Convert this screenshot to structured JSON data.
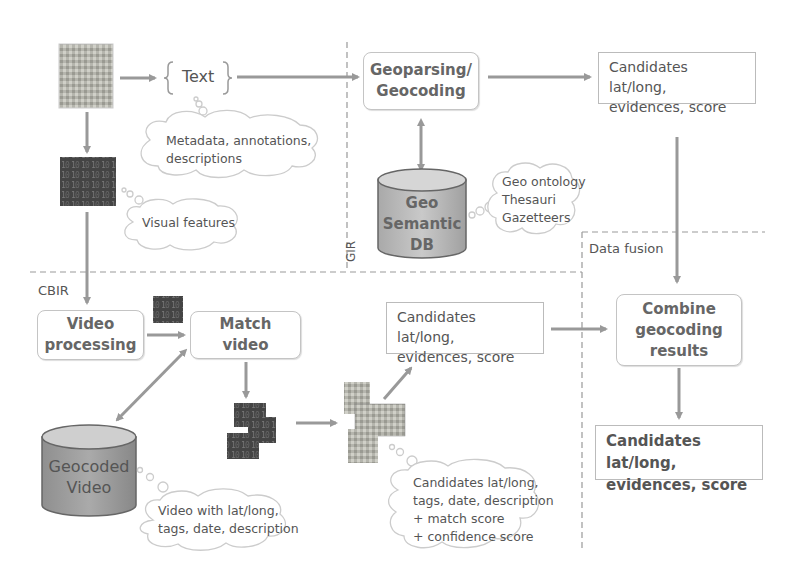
{
  "diagram": {
    "regions": {
      "gir": "GIR",
      "cbir": "CBIR",
      "fusion": "Data fusion"
    },
    "text_node": "Text",
    "boxes": {
      "geoparsing_line1": "Geoparsing/",
      "geoparsing_line2": "Geocoding",
      "video_processing_line1": "Video",
      "video_processing_line2": "processing",
      "match_video_line1": "Match",
      "match_video_line2": "video",
      "combine_line1": "Combine",
      "combine_line2": "geocoding",
      "combine_line3": "results"
    },
    "notes": {
      "gir_candidates_line1": "Candidates lat/long,",
      "gir_candidates_line2": "evidences, score",
      "cbir_candidates_line1": "Candidates lat/long,",
      "cbir_candidates_line2": "evidences, score",
      "final_candidates_line1": "Candidates lat/long,",
      "final_candidates_line2": "evidences, score"
    },
    "databases": {
      "geo_semantic_line1": "Geo",
      "geo_semantic_line2": "Semantic",
      "geo_semantic_line3": "DB",
      "geocoded_video_line1": "Geocoded",
      "geocoded_video_line2": "Video"
    },
    "clouds": {
      "metadata_line1": "Metadata, annotations,",
      "metadata_line2": "descriptions",
      "visual": "Visual features",
      "geo_ontology_line1": "Geo ontology",
      "geo_ontology_line2": "Thesauri",
      "geo_ontology_line3": "Gazetteers",
      "video_info_line1": "Video with lat/long,",
      "video_info_line2": "tags, date, description",
      "match_info_line1": "Candidates lat/long,",
      "match_info_line2": "tags, date, description",
      "match_info_line3": "+ match score",
      "match_info_line4": "+ confidence score"
    }
  }
}
